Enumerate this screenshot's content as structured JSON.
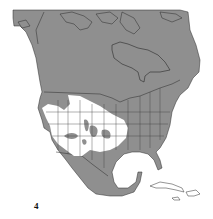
{
  "figure": {
    "label": "4",
    "colors": {
      "background": "#ffffff",
      "land": "#8f8f8f",
      "range": "#ffffff",
      "borders": "#2a2a2a"
    },
    "regions": [
      {
        "name": "Canada",
        "shade": "gray"
      },
      {
        "name": "United States",
        "shade": "gray"
      },
      {
        "name": "Mexico",
        "shade": "gray"
      },
      {
        "name": "Range (western US)",
        "shade": "white"
      },
      {
        "name": "Cuba",
        "shade": "white"
      },
      {
        "name": "Hispaniola",
        "shade": "white"
      },
      {
        "name": "Jamaica",
        "shade": "white"
      }
    ]
  }
}
